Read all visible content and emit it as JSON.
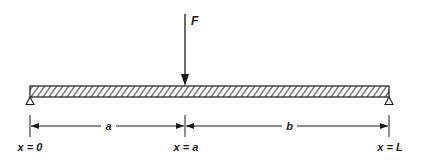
{
  "diagram": {
    "force": {
      "label": "F",
      "x": 185
    },
    "beam": {
      "x_start": 30,
      "x_end": 389,
      "y_top": 86,
      "y_bottom": 97,
      "fill": "hatched"
    },
    "supports": [
      {
        "name": "left-support",
        "type": "pin",
        "x": 30
      },
      {
        "name": "right-support",
        "type": "pin",
        "x": 389
      }
    ],
    "dimensions": [
      {
        "label": "a",
        "from": 30,
        "to": 185
      },
      {
        "label": "b",
        "from": 185,
        "to": 389
      }
    ],
    "positions": [
      {
        "label": "x = 0",
        "x": 30
      },
      {
        "label": "x = a",
        "x": 185
      },
      {
        "label": "x = L",
        "x": 389
      }
    ],
    "colors": {
      "stroke": "#1a1a1a",
      "background": "#ffffff"
    }
  }
}
